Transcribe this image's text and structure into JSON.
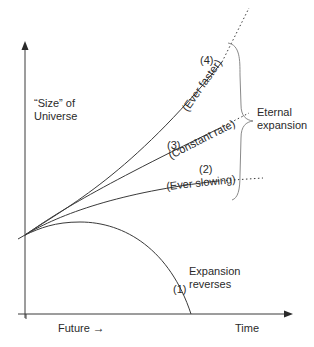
{
  "axes": {
    "y_label_line1": "“Size” of",
    "y_label_line2": "Universe",
    "x_label_future": "Future",
    "x_label_time": "Time",
    "arrow_glyph": "→"
  },
  "curves": [
    {
      "id": "1",
      "number": "(1)",
      "label_line1": "Expansion",
      "label_line2": "reverses"
    },
    {
      "id": "2",
      "number": "(2)",
      "label": "(Ever slowing)"
    },
    {
      "id": "3",
      "number": "(3)",
      "label": "(Constant rate)"
    },
    {
      "id": "4",
      "number": "(4)",
      "label": "(Ever faster)"
    }
  ],
  "brace": {
    "label_line1": "Eternal",
    "label_line2": "expansion"
  },
  "colors": {
    "line": "#3a3a3a",
    "brace": "#8a8a8a",
    "text": "#2a2a2a"
  }
}
